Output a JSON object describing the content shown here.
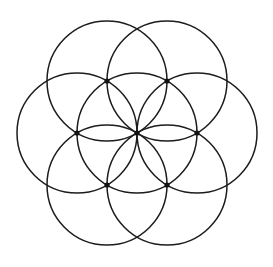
{
  "figure": {
    "name": "Seed of Life",
    "alt_name": "Flower of Life (seven-circle form)",
    "background_color": "#ffffff",
    "stroke_color": "#1c1c1c",
    "node_color": "#111111",
    "stroke_width": 1.5,
    "node_radius": 2.6,
    "canvas": {
      "width": 273,
      "height": 267
    },
    "center": {
      "x": 137,
      "y": 133
    },
    "circle_radius": 60,
    "circle_count": 7,
    "bounds": {
      "left": 17,
      "right": 257,
      "top": 13,
      "bottom": 253
    },
    "circles": [
      {
        "id": "circle-center",
        "label": "Center circle",
        "cx": 137,
        "cy": 133,
        "r": 60,
        "angle_deg": null
      },
      {
        "id": "circle-right",
        "label": "Right circle",
        "cx": 197,
        "cy": 133,
        "r": 60,
        "angle_deg": 0
      },
      {
        "id": "circle-upper-right",
        "label": "Upper right circle",
        "cx": 167,
        "cy": 81,
        "r": 60,
        "angle_deg": 60
      },
      {
        "id": "circle-upper-left",
        "label": "Upper left circle",
        "cx": 107,
        "cy": 81,
        "r": 60,
        "angle_deg": 120
      },
      {
        "id": "circle-left",
        "label": "Left circle",
        "cx": 77,
        "cy": 133,
        "r": 60,
        "angle_deg": 180
      },
      {
        "id": "circle-lower-left",
        "label": "Lower left circle",
        "cx": 107,
        "cy": 185,
        "r": 60,
        "angle_deg": 240
      },
      {
        "id": "circle-lower-right",
        "label": "Lower right circle",
        "cx": 167,
        "cy": 185,
        "r": 60,
        "angle_deg": 300
      }
    ],
    "nodes": [
      {
        "id": "node-center",
        "label": "Center node",
        "cx": 137,
        "cy": 133
      },
      {
        "id": "node-right",
        "label": "Right node",
        "cx": 197,
        "cy": 133
      },
      {
        "id": "node-upper-right",
        "label": "Upper right node",
        "cx": 167,
        "cy": 81
      },
      {
        "id": "node-upper-left",
        "label": "Upper left node",
        "cx": 107,
        "cy": 81
      },
      {
        "id": "node-left",
        "label": "Left node",
        "cx": 77,
        "cy": 133
      },
      {
        "id": "node-lower-left",
        "label": "Lower left node",
        "cx": 107,
        "cy": 185
      },
      {
        "id": "node-lower-right",
        "label": "Lower right node",
        "cx": 167,
        "cy": 185
      }
    ]
  }
}
